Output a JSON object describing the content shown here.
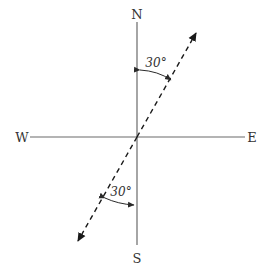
{
  "diagram": {
    "type": "compass-bearing",
    "compass": {
      "north_label": "N",
      "south_label": "S",
      "west_label": "W",
      "east_label": "E"
    },
    "bearing_line": {
      "direction": "N30°E / S30°W",
      "style": "dashed, double-headed arrow",
      "angle_from_vertical_deg": 30
    },
    "angles": [
      {
        "label": "30°",
        "between": "N axis and NE arrow"
      },
      {
        "label": "30°",
        "between": "S axis and SW arrow"
      }
    ],
    "colors": {
      "axis": "#6a6a6a",
      "bearing": "#1a1a1a",
      "text": "#333333"
    }
  }
}
